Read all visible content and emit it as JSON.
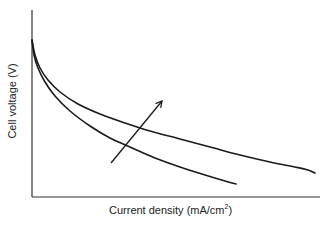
{
  "chart_data": {
    "type": "line",
    "title": "",
    "xlabel": "Current density (mA/cm²)",
    "xlabel_base": "Current density (mA/cm",
    "xlabel_sup": "2",
    "xlabel_tail": ")",
    "ylabel": "Cell voltage (V)",
    "grid": false,
    "legend": null,
    "ticks": "none (qualitative schematic)",
    "axis_color": "#333333",
    "line_color": "#1a1a1a",
    "series": [
      {
        "name": "lower curve",
        "points_px": [
          [
            32,
            40
          ],
          [
            34,
            55
          ],
          [
            38,
            68
          ],
          [
            45,
            82
          ],
          [
            55,
            96
          ],
          [
            70,
            111
          ],
          [
            90,
            126
          ],
          [
            110,
            138
          ],
          [
            130,
            147
          ],
          [
            155,
            158
          ],
          [
            180,
            167
          ],
          [
            205,
            175
          ],
          [
            225,
            181
          ],
          [
            236,
            184
          ]
        ]
      },
      {
        "name": "upper curve",
        "points_px": [
          [
            32,
            40
          ],
          [
            35,
            55
          ],
          [
            40,
            68
          ],
          [
            48,
            80
          ],
          [
            60,
            92
          ],
          [
            78,
            104
          ],
          [
            100,
            114
          ],
          [
            125,
            123
          ],
          [
            150,
            131
          ],
          [
            180,
            139
          ],
          [
            210,
            147
          ],
          [
            240,
            155
          ],
          [
            270,
            162
          ],
          [
            295,
            167
          ],
          [
            308,
            170
          ],
          [
            315,
            173
          ]
        ]
      }
    ],
    "annotations": [
      {
        "type": "arrow",
        "from_px": [
          111,
          163
        ],
        "to_px": [
          162,
          101
        ],
        "meaning": "trend direction (improvement)"
      }
    ],
    "axes_px": {
      "origin": [
        32,
        197
      ],
      "y_top": 10,
      "x_right": 320
    }
  }
}
